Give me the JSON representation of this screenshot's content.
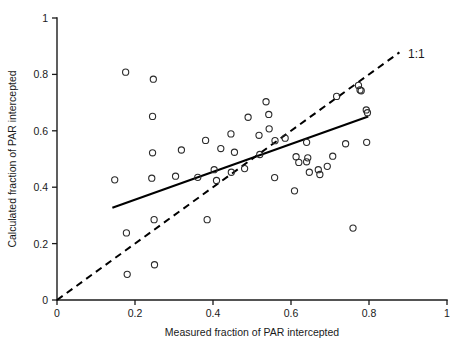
{
  "chart_data": {
    "type": "scatter",
    "title": "",
    "xlabel": "Measured fraction of PAR intercepted",
    "ylabel": "Calculated fraction of PAR intercepted",
    "xlim": [
      0,
      1
    ],
    "ylim": [
      0,
      1
    ],
    "xticks": [
      "0",
      "0.2",
      "0.4",
      "0.6",
      "0.8",
      "1"
    ],
    "yticks": [
      "0",
      "0.2",
      "0.4",
      "0.6",
      "0.8",
      "1"
    ],
    "xtick_values": [
      0,
      0.2,
      0.4,
      0.6,
      0.8,
      1
    ],
    "ytick_values": [
      0,
      0.2,
      0.4,
      0.6,
      0.8,
      1
    ],
    "grid": false,
    "legend": false,
    "marker": "open-circle",
    "points": [
      [
        0.148,
        0.426
      ],
      [
        0.176,
        0.808
      ],
      [
        0.178,
        0.238
      ],
      [
        0.18,
        0.091
      ],
      [
        0.243,
        0.432
      ],
      [
        0.245,
        0.522
      ],
      [
        0.245,
        0.651
      ],
      [
        0.247,
        0.783
      ],
      [
        0.249,
        0.285
      ],
      [
        0.25,
        0.125
      ],
      [
        0.304,
        0.439
      ],
      [
        0.319,
        0.532
      ],
      [
        0.381,
        0.566
      ],
      [
        0.385,
        0.285
      ],
      [
        0.361,
        0.435
      ],
      [
        0.42,
        0.537
      ],
      [
        0.403,
        0.462
      ],
      [
        0.409,
        0.424
      ],
      [
        0.447,
        0.453
      ],
      [
        0.446,
        0.589
      ],
      [
        0.455,
        0.524
      ],
      [
        0.481,
        0.466
      ],
      [
        0.49,
        0.648
      ],
      [
        0.52,
        0.516
      ],
      [
        0.518,
        0.584
      ],
      [
        0.536,
        0.703
      ],
      [
        0.543,
        0.658
      ],
      [
        0.544,
        0.607
      ],
      [
        0.559,
        0.565
      ],
      [
        0.558,
        0.434
      ],
      [
        0.585,
        0.574
      ],
      [
        0.609,
        0.387
      ],
      [
        0.613,
        0.508
      ],
      [
        0.62,
        0.488
      ],
      [
        0.64,
        0.559
      ],
      [
        0.64,
        0.49
      ],
      [
        0.647,
        0.453
      ],
      [
        0.643,
        0.504
      ],
      [
        0.67,
        0.462
      ],
      [
        0.674,
        0.445
      ],
      [
        0.693,
        0.474
      ],
      [
        0.707,
        0.51
      ],
      [
        0.717,
        0.722
      ],
      [
        0.74,
        0.554
      ],
      [
        0.759,
        0.255
      ],
      [
        0.773,
        0.761
      ],
      [
        0.777,
        0.745
      ],
      [
        0.78,
        0.742
      ],
      [
        0.794,
        0.559
      ],
      [
        0.793,
        0.674
      ],
      [
        0.796,
        0.664
      ]
    ],
    "fit_line": {
      "name": "regression",
      "style": "solid",
      "x": [
        0.142,
        0.798
      ],
      "y": [
        0.327,
        0.651
      ]
    },
    "reference_line": {
      "name": "1:1 line",
      "label": "1:1",
      "style": "dashed",
      "x": [
        0.0,
        0.878
      ],
      "y": [
        0.0,
        0.878
      ]
    },
    "annotations": [
      {
        "text": "1:1",
        "x": 0.9,
        "y": 0.872
      }
    ]
  },
  "axes": {
    "x_title": "Measured fraction of PAR intercepted",
    "y_title": "Calculated fraction of PAR intercepted"
  },
  "colors": {
    "axis": "#1a1a1a",
    "marker": "#2b2b2b",
    "fit": "#000000",
    "reference": "#000000",
    "background": "#ffffff"
  }
}
